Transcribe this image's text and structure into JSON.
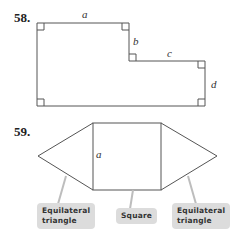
{
  "problems": [
    {
      "number": "58.",
      "labels": {
        "a": "a",
        "b": "b",
        "c": "c",
        "d": "d"
      }
    },
    {
      "number": "59.",
      "labels": {
        "a": "a"
      },
      "callouts": [
        {
          "line1": "Equilateral",
          "line2": "triangle"
        },
        {
          "line1": "Square"
        },
        {
          "line1": "Equilateral",
          "line2": "triangle"
        }
      ]
    }
  ],
  "colors": {
    "line": "#555555",
    "callout_bg": "#dcdcdc"
  }
}
